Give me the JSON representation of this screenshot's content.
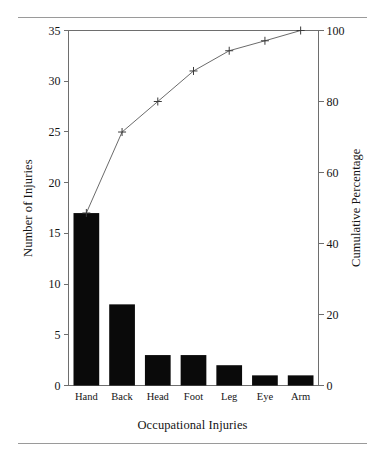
{
  "figure": {
    "background_color": "#ffffff",
    "has_top_rule": true,
    "has_bottom_rule": true
  },
  "chart_data": {
    "type": "bar",
    "title": "",
    "subtitle": "",
    "xlabel": "Occupational Injuries",
    "ylabel": "Number of Injuries",
    "y2label": "Cumulative Percentage",
    "categories": [
      "Hand",
      "Back",
      "Head",
      "Foot",
      "Leg",
      "Eye",
      "Arm"
    ],
    "values": [
      17,
      8,
      3,
      3,
      2,
      1,
      1
    ],
    "series": [
      {
        "name": "Number of Injuries",
        "type": "bar",
        "axis": "left",
        "color": "#0a0a0a",
        "values": [
          17,
          8,
          3,
          3,
          2,
          1,
          1
        ]
      },
      {
        "name": "Cumulative Percentage",
        "type": "line",
        "axis": "right",
        "color": "#6b6b6b",
        "marker": "plus",
        "values_count": [
          17,
          25,
          28,
          31,
          33,
          34,
          35
        ],
        "values_percent": [
          48.6,
          71.4,
          80.0,
          88.6,
          94.3,
          97.1,
          100.0
        ]
      }
    ],
    "ylim": [
      0,
      35
    ],
    "yticks": [
      0,
      5,
      10,
      15,
      20,
      25,
      30,
      35
    ],
    "yticklabels": [
      "0",
      "5",
      "10",
      "15",
      "20",
      "25",
      "30",
      "35"
    ],
    "y2lim": [
      0,
      100
    ],
    "y2ticks": [
      0,
      20,
      40,
      60,
      80,
      100
    ],
    "y2ticklabels": [
      "0",
      "20",
      "40",
      "60",
      "80",
      "100"
    ],
    "grid": false,
    "legend": "none",
    "total_injuries": 35
  }
}
